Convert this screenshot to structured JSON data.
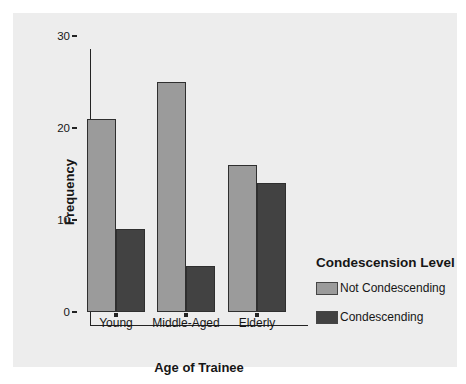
{
  "chart_data": {
    "type": "bar",
    "title": "",
    "categories": [
      "Young",
      "Middle-Aged",
      "Elderly"
    ],
    "series": [
      {
        "name": "Not Condescending",
        "color": "#9b9b9b",
        "values": [
          21,
          25,
          16
        ]
      },
      {
        "name": "Condescending",
        "color": "#424242",
        "values": [
          9,
          5,
          14
        ]
      }
    ],
    "xlabel": "Age of Trainee",
    "ylabel": "Frequency",
    "ylim": [
      0,
      30
    ],
    "yticks": [
      0,
      10,
      20,
      30
    ],
    "legend_title": "Condescension Level",
    "legend_position": "right-bottom",
    "grid": false,
    "panel_background": "#ededed",
    "axis_color": "#232323"
  }
}
